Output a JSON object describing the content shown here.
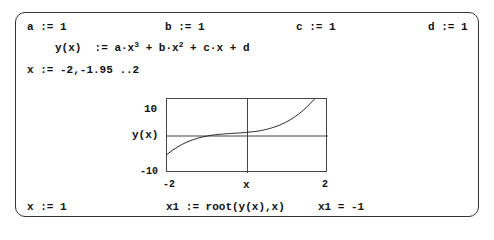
{
  "worksheet": {
    "definitions": [
      {
        "id": "a",
        "text": "a := 1"
      },
      {
        "id": "b",
        "text": "b := 1"
      },
      {
        "id": "c",
        "text": "c := 1"
      },
      {
        "id": "d",
        "text": "d := 1"
      }
    ],
    "function_def": {
      "lhs": "y(x)",
      "op": ":=",
      "terms": [
        "a·x",
        "3",
        " + b·x",
        "2",
        " + c·x + d"
      ]
    },
    "range_def": "x := -2,-1.95 ..2",
    "guess": "x := 1",
    "root_def": "x1 := root(y(x),x)",
    "root_result": "x1 = -1"
  },
  "chart_data": {
    "type": "line",
    "title": "",
    "xlabel": "x",
    "ylabel": "y(x)",
    "xlim": [
      -2,
      2
    ],
    "ylim": [
      -10,
      10
    ],
    "x_tick_labels": [
      "-2",
      "2"
    ],
    "y_tick_labels": [
      "10",
      "-10"
    ],
    "y_top_label": "10",
    "y_bottom_label": "-10",
    "x_left_label": "-2",
    "x_right_label": "2",
    "grid": false,
    "axes_lines_at_zero": true,
    "series": [
      {
        "name": "y(x) = x^3 + x^2 + x + 1",
        "x": [
          -2,
          -1.5,
          -1,
          -0.5,
          0,
          0.5,
          1,
          1.5,
          2
        ],
        "values": [
          -5,
          -1.625,
          0,
          0.625,
          1,
          1.875,
          4,
          8.125,
          15
        ]
      }
    ]
  }
}
